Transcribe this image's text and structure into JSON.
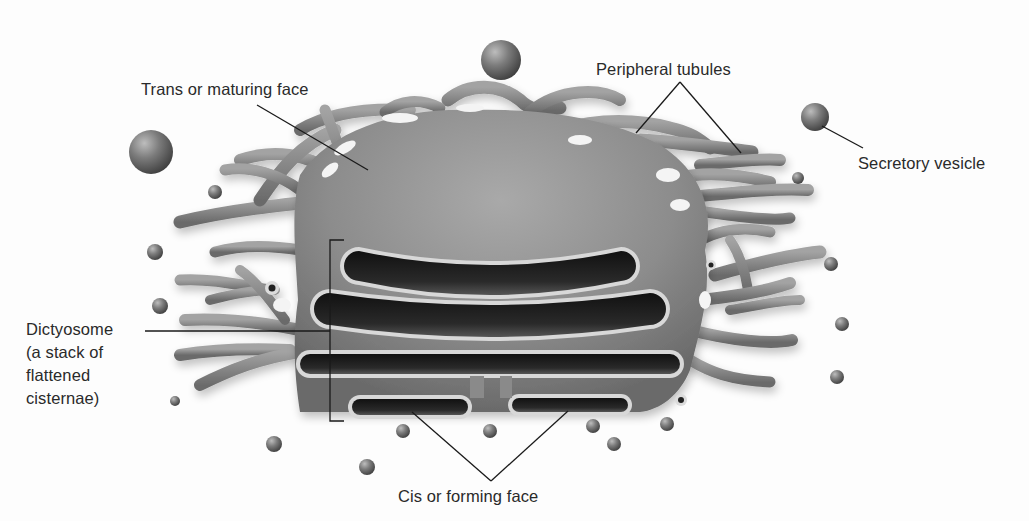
{
  "diagram": {
    "colors": {
      "background": "#fdfdfd",
      "membrane_fill": "#8a8a8a",
      "membrane_light": "#b4b4b4",
      "membrane_dark": "#5e5e5e",
      "lumen": "#1e1e1e",
      "rim": "#d6d6d6",
      "vesicle": "#777777",
      "leader_line": "#1a1a1a",
      "label_text": "#2a2a2a"
    },
    "labels": {
      "trans_face": {
        "text": "Trans or maturing face",
        "x": 141,
        "y": 78,
        "leader": [
          [
            257,
            105
          ],
          [
            368,
            170
          ]
        ]
      },
      "peripheral_tubules": {
        "text": "Peripheral tubules",
        "x": 596,
        "y": 58,
        "leader_apex": [
          680,
          82
        ],
        "leader_ends": [
          [
            636,
            133
          ],
          [
            741,
            153
          ]
        ]
      },
      "secretory_vesicle": {
        "text": "Secretory vesicle",
        "x": 858,
        "y": 152,
        "leader": [
          [
            822,
            126
          ],
          [
            863,
            148
          ]
        ]
      },
      "dictyosome": {
        "lines": [
          "Dictyosome",
          "(a stack of",
          "flattened",
          "cisternae)"
        ],
        "x": 26,
        "y": 318,
        "leader": [
          [
            145,
            331
          ],
          [
            330,
            331
          ]
        ],
        "bracket": {
          "x": 330,
          "top": 240,
          "bottom": 421,
          "tick": 14
        }
      },
      "cis_face": {
        "text": "Cis or forming face",
        "x": 398,
        "y": 485,
        "leader_apex": [
          491,
          481
        ],
        "leader_ends": [
          [
            412,
            412
          ],
          [
            568,
            411
          ]
        ]
      }
    },
    "cisternae": [
      {
        "name": "cisterna-1-trans",
        "x": 340,
        "y": 247,
        "w": 300,
        "h": 38,
        "sag": 14
      },
      {
        "name": "cisterna-2",
        "x": 310,
        "y": 289,
        "w": 360,
        "h": 40,
        "sag": 12
      },
      {
        "name": "cisterna-3",
        "x": 296,
        "y": 350,
        "w": 388,
        "h": 28,
        "sag": 0
      },
      {
        "name": "cisterna-4-cis-left",
        "x": 348,
        "y": 395,
        "w": 124,
        "h": 24,
        "sag": 0
      },
      {
        "name": "cisterna-5-cis-right",
        "x": 508,
        "y": 394,
        "w": 124,
        "h": 22,
        "sag": 0
      }
    ],
    "large_vesicles": [
      {
        "cx": 151,
        "cy": 152,
        "r": 22
      },
      {
        "cx": 501,
        "cy": 60,
        "r": 20
      },
      {
        "cx": 815,
        "cy": 117,
        "r": 14
      }
    ],
    "small_vesicles": [
      {
        "cx": 215,
        "cy": 192,
        "r": 7
      },
      {
        "cx": 155,
        "cy": 252,
        "r": 8
      },
      {
        "cx": 160,
        "cy": 306,
        "r": 8
      },
      {
        "cx": 175,
        "cy": 401,
        "r": 5
      },
      {
        "cx": 274,
        "cy": 444,
        "r": 8
      },
      {
        "cx": 367,
        "cy": 467,
        "r": 8
      },
      {
        "cx": 403,
        "cy": 431,
        "r": 7
      },
      {
        "cx": 490,
        "cy": 431,
        "r": 7
      },
      {
        "cx": 593,
        "cy": 426,
        "r": 7
      },
      {
        "cx": 614,
        "cy": 444,
        "r": 7
      },
      {
        "cx": 667,
        "cy": 424,
        "r": 7
      },
      {
        "cx": 798,
        "cy": 178,
        "r": 6
      },
      {
        "cx": 831,
        "cy": 264,
        "r": 7
      },
      {
        "cx": 842,
        "cy": 324,
        "r": 7
      },
      {
        "cx": 837,
        "cy": 377,
        "r": 7
      }
    ],
    "pore_vesicles": [
      {
        "cx": 272,
        "cy": 288,
        "r": 7
      },
      {
        "cx": 711,
        "cy": 265,
        "r": 5
      },
      {
        "cx": 681,
        "cy": 400,
        "r": 6
      }
    ]
  }
}
